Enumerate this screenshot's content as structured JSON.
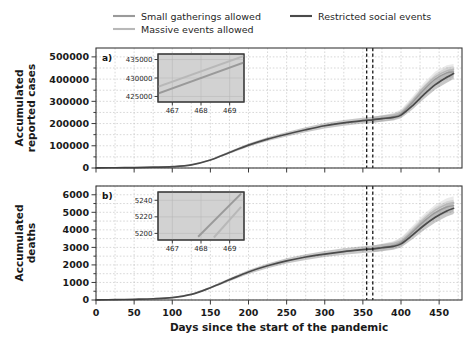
{
  "figure": {
    "width": 475,
    "height": 353,
    "background": "#ffffff"
  },
  "legend": {
    "position": "top-center",
    "entries": [
      {
        "label": "Small gatherings allowed",
        "color": "#9a9a9a",
        "icon": "line-swatch"
      },
      {
        "label": "Restricted social events",
        "color": "#4a4a4a",
        "icon": "line-swatch"
      },
      {
        "label": "Massive events allowed",
        "color": "#b8b8b8",
        "icon": "line-swatch"
      }
    ]
  },
  "xaxis": {
    "label": "Days since the start of the pandemic",
    "ticks": [
      "0",
      "50",
      "100",
      "150",
      "200",
      "250",
      "300",
      "350",
      "400",
      "450"
    ],
    "tick_values": [
      0,
      50,
      100,
      150,
      200,
      250,
      300,
      350,
      400,
      450
    ],
    "min": 0,
    "max": 480,
    "minor_step": 25
  },
  "panels": [
    {
      "letter": "a)",
      "ylabel": "Accumulated\nreported cases",
      "ylabel_line1": "Accumulated",
      "ylabel_line2": "reported cases",
      "yticks": [
        "0",
        "100000",
        "200000",
        "300000",
        "400000",
        "500000"
      ],
      "ytick_values": [
        0,
        100000,
        200000,
        300000,
        400000,
        500000
      ],
      "ymin": 0,
      "ymax": 540000,
      "inset": {
        "xticks": [
          "467",
          "468",
          "469"
        ],
        "xtick_values": [
          467,
          468,
          469
        ],
        "yticks": [
          "425000",
          "430000",
          "435000"
        ],
        "ytick_values": [
          425000,
          430000,
          435000
        ],
        "xmin": 466.5,
        "xmax": 469.5,
        "ymin": 423500,
        "ymax": 436500,
        "background": "#d2d2d2"
      }
    },
    {
      "letter": "b)",
      "ylabel": "Accumulated\ndeaths",
      "ylabel_line1": "Accumulated",
      "ylabel_line2": "deaths",
      "yticks": [
        "0",
        "1000",
        "2000",
        "3000",
        "4000",
        "5000",
        "6000"
      ],
      "ytick_values": [
        0,
        1000,
        2000,
        3000,
        4000,
        5000,
        6000
      ],
      "ymin": 0,
      "ymax": 6500,
      "inset": {
        "xticks": [
          "467",
          "468",
          "469"
        ],
        "xtick_values": [
          467,
          468,
          469
        ],
        "yticks": [
          "5200",
          "5220",
          "5240"
        ],
        "ytick_values": [
          5200,
          5220,
          5240
        ],
        "xmin": 466.5,
        "xmax": 469.5,
        "ymin": 5192,
        "ymax": 5250,
        "background": "#d2d2d2"
      }
    }
  ],
  "annotations": {
    "vertical_lines": [
      355,
      363
    ]
  },
  "chart_data": {
    "type": "line",
    "title": "",
    "xlabel": "Days since the start of the pandemic",
    "grid": true,
    "legend_position": "top-center",
    "subplots": [
      {
        "panel": "a)",
        "ylabel": "Accumulated reported cases",
        "xlim": [
          0,
          480
        ],
        "ylim": [
          0,
          540000
        ],
        "xticks": [
          0,
          50,
          100,
          150,
          200,
          250,
          300,
          350,
          400,
          450
        ],
        "yticks": [
          0,
          100000,
          200000,
          300000,
          400000,
          500000
        ],
        "vertical_reference_lines": [
          355,
          363
        ],
        "series": [
          {
            "name": "Restricted social events",
            "color": "#4a4a4a",
            "x": [
              0,
              25,
              50,
              75,
              100,
              125,
              150,
              175,
              200,
              225,
              250,
              275,
              300,
              325,
              350,
              363,
              375,
              390,
              400,
              415,
              430,
              445,
              460,
              469
            ],
            "values": [
              800,
              1200,
              2000,
              3500,
              6000,
              14000,
              36000,
              70000,
              103000,
              130000,
              152000,
              172000,
              190000,
              203000,
              213000,
              217000,
              222000,
              228000,
              238000,
              280000,
              330000,
              375000,
              408000,
              425000
            ]
          },
          {
            "name": "Small gatherings allowed",
            "color": "#9a9a9a",
            "x": [
              363,
              375,
              390,
              400,
              415,
              430,
              445,
              460,
              469
            ],
            "values": [
              217000,
              223000,
              231000,
              244000,
              295000,
              352000,
              400000,
              428000,
              432500
            ]
          },
          {
            "name": "Massive events allowed",
            "color": "#b8b8b8",
            "x": [
              363,
              375,
              390,
              400,
              415,
              430,
              445,
              460,
              469
            ],
            "values": [
              217000,
              224000,
              233000,
              248000,
              303000,
              362000,
              410000,
              437000,
              442000
            ]
          }
        ],
        "uncertainty_bands": true,
        "inset": {
          "xlim": [
            466.5,
            469.5
          ],
          "ylim": [
            423500,
            436500
          ],
          "xticks": [
            467,
            468,
            469
          ],
          "yticks": [
            425000,
            430000,
            435000
          ],
          "series": [
            {
              "name": "Small gatherings allowed",
              "color": "#9a9a9a",
              "x": [
                466.5,
                469.5
              ],
              "values": [
                425800,
                434200
              ]
            },
            {
              "name": "Massive events allowed",
              "color": "#b8b8b8",
              "x": [
                466.5,
                469.5
              ],
              "values": [
                427600,
                436000
              ]
            }
          ]
        }
      },
      {
        "panel": "b)",
        "ylabel": "Accumulated deaths",
        "xlim": [
          0,
          480
        ],
        "ylim": [
          0,
          6500
        ],
        "xticks": [
          0,
          50,
          100,
          150,
          200,
          250,
          300,
          350,
          400,
          450
        ],
        "yticks": [
          0,
          1000,
          2000,
          3000,
          4000,
          5000,
          6000
        ],
        "vertical_reference_lines": [
          355,
          363
        ],
        "series": [
          {
            "name": "Restricted social events",
            "color": "#4a4a4a",
            "x": [
              0,
              25,
              50,
              75,
              100,
              125,
              150,
              175,
              200,
              225,
              250,
              275,
              300,
              325,
              350,
              363,
              375,
              390,
              400,
              415,
              430,
              445,
              460,
              469
            ],
            "values": [
              10,
              20,
              40,
              70,
              140,
              320,
              700,
              1150,
              1600,
              1950,
              2230,
              2450,
              2620,
              2760,
              2870,
              2920,
              2980,
              3060,
              3200,
              3700,
              4250,
              4720,
              5080,
              5230
            ]
          },
          {
            "name": "Small gatherings allowed",
            "color": "#9a9a9a",
            "x": [
              363,
              375,
              390,
              400,
              415,
              430,
              445,
              460,
              469
            ],
            "values": [
              2920,
              3000,
              3110,
              3290,
              3870,
              4480,
              4980,
              5300,
              5375
            ]
          },
          {
            "name": "Massive events allowed",
            "color": "#b8b8b8",
            "x": [
              363,
              375,
              390,
              400,
              415,
              430,
              445,
              460,
              469
            ],
            "values": [
              2920,
              3010,
              3140,
              3340,
              3960,
              4600,
              5120,
              5460,
              5560
            ]
          }
        ],
        "uncertainty_bands": true,
        "inset": {
          "xlim": [
            466.5,
            469.5
          ],
          "ylim": [
            5192,
            5250
          ],
          "xticks": [
            467,
            468,
            469
          ],
          "yticks": [
            5200,
            5220,
            5240
          ],
          "series": [
            {
              "name": "Small gatherings allowed",
              "color": "#9a9a9a",
              "x": [
                467.9,
                469.4
              ],
              "values": [
                5196,
                5248
              ]
            },
            {
              "name": "Massive events allowed",
              "color": "#b8b8b8",
              "x": [
                468.45,
                469.4
              ],
              "values": [
                5195,
                5232
              ]
            }
          ]
        }
      }
    ]
  }
}
